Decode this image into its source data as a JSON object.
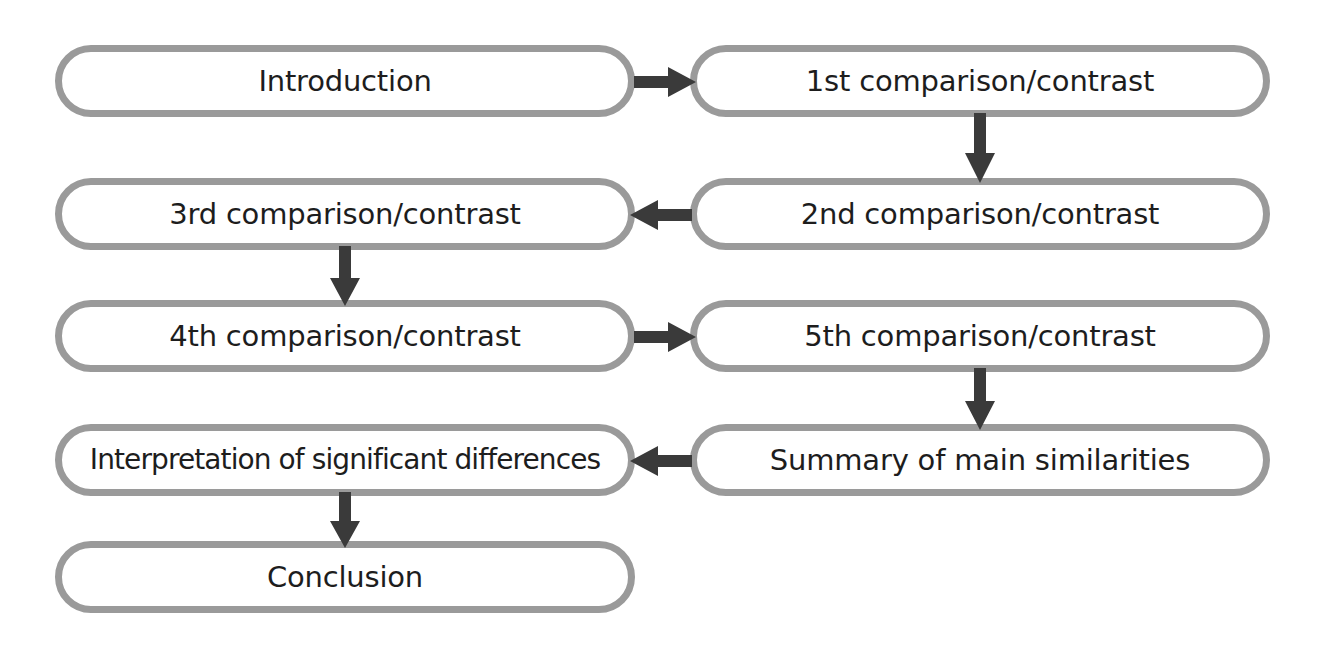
{
  "diagram": {
    "type": "flowchart",
    "style": {
      "node_border_color": "#9a9a9a",
      "node_fill_color": "#ffffff",
      "node_text_color": "#1d1d1d",
      "arrow_color": "#3a3a3a",
      "background_color": "#ffffff"
    },
    "nodes": [
      {
        "id": "introduction",
        "label": "Introduction",
        "column": "left",
        "row": 1,
        "x": 55,
        "y": 45,
        "width": 580,
        "height": 72
      },
      {
        "id": "comparison-1",
        "label": "1st comparison/contrast",
        "column": "right",
        "row": 1,
        "x": 690,
        "y": 45,
        "width": 580,
        "height": 72
      },
      {
        "id": "comparison-3",
        "label": "3rd comparison/contrast",
        "column": "left",
        "row": 2,
        "x": 55,
        "y": 178,
        "width": 580,
        "height": 72
      },
      {
        "id": "comparison-2",
        "label": "2nd comparison/contrast",
        "column": "right",
        "row": 2,
        "x": 690,
        "y": 178,
        "width": 580,
        "height": 72
      },
      {
        "id": "comparison-4",
        "label": "4th comparison/contrast",
        "column": "left",
        "row": 3,
        "x": 55,
        "y": 300,
        "width": 580,
        "height": 72
      },
      {
        "id": "comparison-5",
        "label": "5th comparison/contrast",
        "column": "right",
        "row": 3,
        "x": 690,
        "y": 300,
        "width": 580,
        "height": 72
      },
      {
        "id": "interpretation",
        "label": "Interpretation of significant differences",
        "column": "left",
        "row": 4,
        "x": 55,
        "y": 424,
        "width": 580,
        "height": 72
      },
      {
        "id": "summary",
        "label": "Summary of main similarities",
        "column": "right",
        "row": 4,
        "x": 690,
        "y": 424,
        "width": 580,
        "height": 72
      },
      {
        "id": "conclusion",
        "label": "Conclusion",
        "column": "left",
        "row": 5,
        "x": 55,
        "y": 541,
        "width": 580,
        "height": 72
      }
    ],
    "arrows": [
      {
        "id": "arrow-introduction-to-comparison-1",
        "from": "introduction",
        "to": "comparison-1",
        "direction": "right"
      },
      {
        "id": "arrow-comparison-1-to-comparison-2",
        "from": "comparison-1",
        "to": "comparison-2",
        "direction": "down"
      },
      {
        "id": "arrow-comparison-2-to-comparison-3",
        "from": "comparison-2",
        "to": "comparison-3",
        "direction": "left"
      },
      {
        "id": "arrow-comparison-3-to-comparison-4",
        "from": "comparison-3",
        "to": "comparison-4",
        "direction": "down"
      },
      {
        "id": "arrow-comparison-4-to-comparison-5",
        "from": "comparison-4",
        "to": "comparison-5",
        "direction": "right"
      },
      {
        "id": "arrow-comparison-5-to-summary",
        "from": "comparison-5",
        "to": "summary",
        "direction": "down"
      },
      {
        "id": "arrow-summary-to-interpretation",
        "from": "summary",
        "to": "interpretation",
        "direction": "left"
      },
      {
        "id": "arrow-interpretation-to-conclusion",
        "from": "interpretation",
        "to": "conclusion",
        "direction": "down"
      }
    ]
  }
}
